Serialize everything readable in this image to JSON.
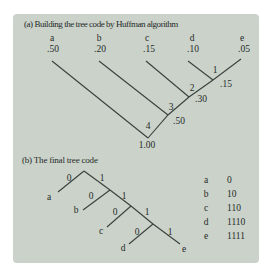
{
  "panel": {
    "background": "#cad2ca",
    "text_color": "#272b29",
    "line_color": "#3a403c"
  },
  "section_a": {
    "title": "(a) Building the tree code by Huffman algorithm",
    "leaves": [
      {
        "symbol": "a",
        "prob": ".50"
      },
      {
        "symbol": "b",
        "prob": ".20"
      },
      {
        "symbol": "c",
        "prob": ".15"
      },
      {
        "symbol": "d",
        "prob": ".10"
      },
      {
        "symbol": "e",
        "prob": ".05"
      }
    ],
    "merges": [
      {
        "step": "1",
        "prob": ".15"
      },
      {
        "step": "2",
        "prob": ".30"
      },
      {
        "step": "3",
        "prob": ".50"
      },
      {
        "step": "4",
        "prob": "1.00"
      }
    ]
  },
  "section_b": {
    "title": "(b) The final tree code",
    "edge_labels": [
      "0",
      "1",
      "0",
      "1",
      "0",
      "1",
      "0",
      "1"
    ],
    "leaves": [
      "a",
      "b",
      "c",
      "d",
      "e"
    ],
    "code_table": [
      {
        "symbol": "a",
        "code": "0"
      },
      {
        "symbol": "b",
        "code": "10"
      },
      {
        "symbol": "c",
        "code": "110"
      },
      {
        "symbol": "d",
        "code": "1110"
      },
      {
        "symbol": "e",
        "code": "1111"
      }
    ]
  }
}
